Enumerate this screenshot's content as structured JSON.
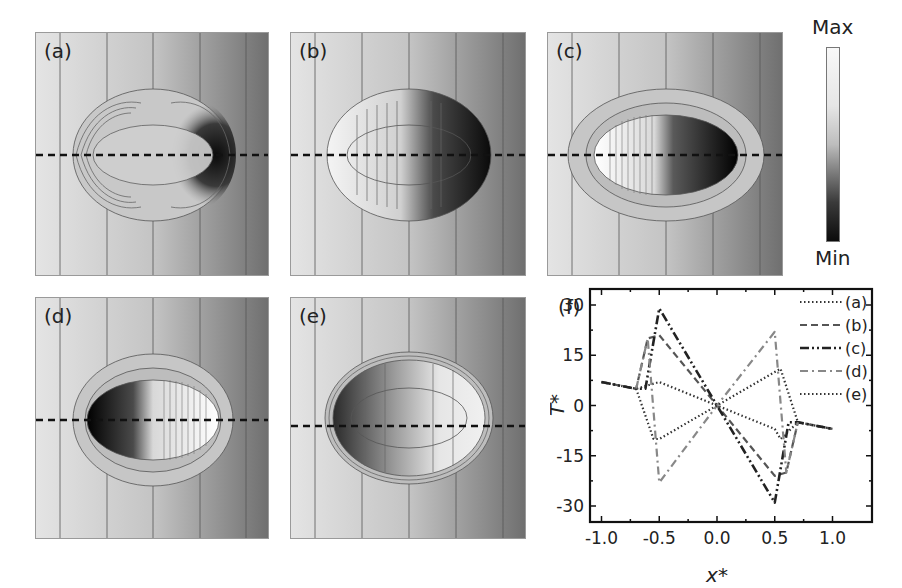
{
  "figure": {
    "panels": [
      {
        "id": "a",
        "label": "(a)"
      },
      {
        "id": "b",
        "label": "(b)"
      },
      {
        "id": "c",
        "label": "(c)"
      },
      {
        "id": "d",
        "label": "(d)"
      },
      {
        "id": "e",
        "label": "(e)"
      }
    ],
    "colorbar": {
      "max_label": "Max",
      "min_label": "Min"
    },
    "panel_f_label": "(f)"
  },
  "chart_data": {
    "type": "line",
    "title": "",
    "panel_label": "(f)",
    "xlabel": "x*",
    "ylabel": "T*",
    "xlim": [
      -1.1,
      1.1
    ],
    "ylim": [
      -35,
      35
    ],
    "xticks": [
      -1.0,
      -0.5,
      0.0,
      0.5,
      1.0
    ],
    "xtick_labels": [
      "-1.0",
      "-0.5",
      "0.0",
      "0.5",
      "1.0"
    ],
    "yticks": [
      -30,
      -15,
      0,
      15,
      30
    ],
    "ytick_labels": [
      "-30",
      "-15",
      "0",
      "15",
      "30"
    ],
    "grid": false,
    "legend_position": "upper right",
    "series": [
      {
        "name": "(a)",
        "style": "dotted",
        "color": "#333333",
        "x": [
          -1.0,
          -0.7,
          -0.5,
          0.0,
          0.5,
          0.55,
          0.7,
          1.0
        ],
        "y": [
          7,
          5,
          7,
          0,
          -7,
          -10,
          -5,
          -7
        ]
      },
      {
        "name": "(b)",
        "style": "dashed",
        "color": "#555555",
        "x": [
          -1.0,
          -0.7,
          -0.6,
          -0.5,
          0.0,
          0.5,
          0.6,
          0.7,
          1.0
        ],
        "y": [
          7,
          5,
          20,
          21,
          0,
          -21,
          -20,
          -5,
          -7
        ]
      },
      {
        "name": "(c)",
        "style": "dash-dot-dot",
        "color": "#222222",
        "x": [
          -1.0,
          -0.7,
          -0.62,
          -0.5,
          0.0,
          0.5,
          0.62,
          0.7,
          1.0
        ],
        "y": [
          7,
          5,
          5,
          29,
          0,
          -29,
          -5,
          -5,
          -7
        ]
      },
      {
        "name": "(d)",
        "style": "dash-dot",
        "color": "#888888",
        "x": [
          -0.7,
          -0.6,
          -0.5,
          0.0,
          0.5,
          0.6,
          0.7
        ],
        "y": [
          5,
          20,
          -23,
          0,
          22,
          -20,
          -5
        ]
      },
      {
        "name": "(e)",
        "style": "dotted",
        "color": "#333333",
        "x": [
          -0.7,
          -0.55,
          -0.5,
          0.0,
          0.5,
          0.55,
          0.7
        ],
        "y": [
          5,
          -10,
          -10,
          0,
          10,
          11,
          -5
        ]
      }
    ]
  }
}
